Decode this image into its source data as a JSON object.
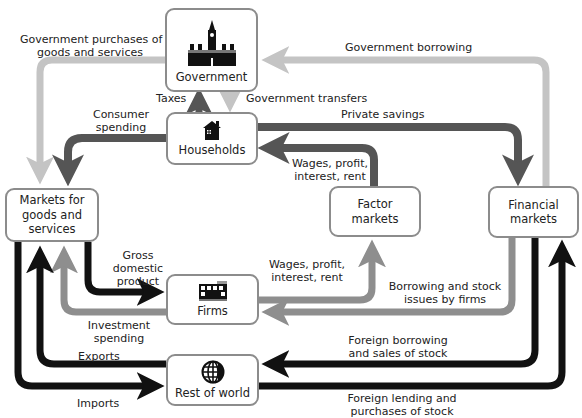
{
  "diagram": {
    "colors": {
      "black_flow": "#111111",
      "dark_flow": "#555555",
      "medium_flow": "#8e8e8e",
      "light_flow": "#c4c4c4",
      "box_border": "#8c8c8c"
    },
    "nodes": {
      "government": {
        "label": "Government",
        "icon": "parliament-icon"
      },
      "households": {
        "label": "Households",
        "icon": "house-icon"
      },
      "markets_goods": {
        "line1": "Markets for",
        "line2": "goods and",
        "line3": "services"
      },
      "factor_markets": {
        "line1": "Factor",
        "line2": "markets"
      },
      "financial_markets": {
        "line1": "Financial",
        "line2": "markets"
      },
      "firms": {
        "label": "Firms",
        "icon": "factory-icon"
      },
      "rest_of_world": {
        "label": "Rest of world",
        "icon": "globe-icon"
      }
    },
    "flows": {
      "gov_purchases": {
        "line1": "Government purchases of",
        "line2": "goods and services"
      },
      "gov_borrowing": {
        "label": "Government borrowing"
      },
      "taxes": {
        "label": "Taxes"
      },
      "gov_transfers": {
        "label": "Government transfers"
      },
      "consumer_spending": {
        "line1": "Consumer",
        "line2": "spending"
      },
      "private_savings": {
        "label": "Private savings"
      },
      "wages_to_households": {
        "line1": "Wages, profit,",
        "line2": "interest, rent"
      },
      "gdp": {
        "line1": "Gross",
        "line2": "domestic",
        "line3": "product"
      },
      "wages_from_firms": {
        "line1": "Wages, profit,",
        "line2": "interest, rent"
      },
      "borrowing_firms": {
        "line1": "Borrowing and stock",
        "line2": "issues by firms"
      },
      "investment_spending": {
        "line1": "Investment",
        "line2": "spending"
      },
      "foreign_borrowing": {
        "line1": "Foreign borrowing",
        "line2": "and sales of stock"
      },
      "exports": {
        "label": "Exports"
      },
      "imports": {
        "label": "Imports"
      },
      "foreign_lending": {
        "line1": "Foreign lending and",
        "line2": "purchases of stock"
      }
    }
  }
}
